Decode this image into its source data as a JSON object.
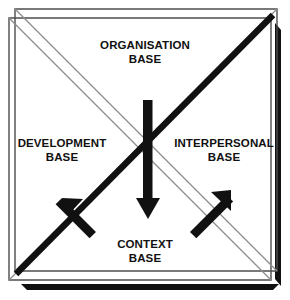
{
  "diagram": {
    "shape": "square",
    "colors": {
      "background": "#ffffff",
      "outline": "#4d4d4d",
      "thin_diagonal": "#8c8c8c",
      "bold_element": "#111111",
      "text": "#111111"
    },
    "quadrants": [
      {
        "id": "organisation",
        "position": "top",
        "line1": "ORGANISATION",
        "line2": "BASE"
      },
      {
        "id": "development",
        "position": "left",
        "line1": "DEVELOPMENT",
        "line2": "BASE"
      },
      {
        "id": "interpersonal",
        "position": "right",
        "line1": "INTERPERSONAL",
        "line2": "BASE"
      },
      {
        "id": "context",
        "position": "bottom",
        "line1": "CONTEXT",
        "line2": "BASE"
      }
    ],
    "arrows": [
      {
        "id": "center-down-arrow",
        "name": "center-down-arrow",
        "direction": "down",
        "from": "organisation",
        "to": "context"
      },
      {
        "id": "lower-left-arrow",
        "name": "up-left-arrow",
        "direction": "up-left",
        "from": "context",
        "to": "development"
      },
      {
        "id": "lower-right-arrow",
        "name": "up-right-arrow",
        "direction": "up-right",
        "from": "context",
        "to": "interpersonal"
      },
      {
        "id": "bold-diagonal",
        "name": "bold-diagonal-line",
        "direction": "bottom-left-to-top-right",
        "from": "development",
        "to": "interpersonal"
      }
    ]
  }
}
